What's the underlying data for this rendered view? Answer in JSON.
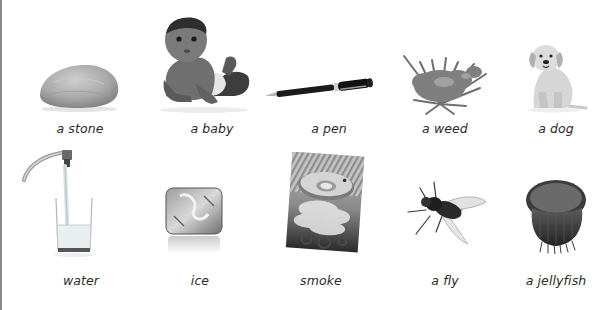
{
  "rows": [
    {
      "items": [
        {
          "label": "a stone",
          "icon": "stone-icon"
        },
        {
          "label": "a baby",
          "icon": "baby-icon"
        },
        {
          "label": "a pen",
          "icon": "pen-icon"
        },
        {
          "label": "a weed",
          "icon": "weed-icon"
        },
        {
          "label": "a dog",
          "icon": "dog-icon"
        }
      ]
    },
    {
      "items": [
        {
          "label": "water",
          "icon": "water-glass-icon"
        },
        {
          "label": "ice",
          "icon": "ice-cube-icon"
        },
        {
          "label": "smoke",
          "icon": "smoke-detector-icon"
        },
        {
          "label": "a fly",
          "icon": "fly-icon"
        },
        {
          "label": "a jellyfish",
          "icon": "jellyfish-icon"
        }
      ]
    }
  ],
  "colors": {
    "caption": "#2a2a2a",
    "border": "#8a8a8a",
    "background": "#ffffff"
  }
}
